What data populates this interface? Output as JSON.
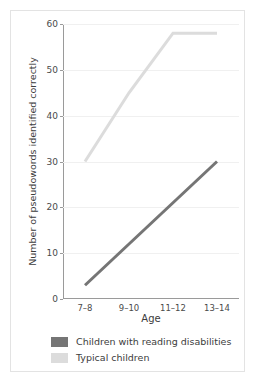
{
  "chart_data": {
    "type": "line",
    "title": "",
    "xlabel": "Age",
    "ylabel": "Number of pseudowords identified correctly",
    "categories": [
      "7–8",
      "9–10",
      "11–12",
      "13–14"
    ],
    "series": [
      {
        "name": "Children with reading disabilities",
        "values": [
          3,
          12,
          21,
          30
        ],
        "color": "#757575"
      },
      {
        "name": "Typical children",
        "values": [
          30,
          45,
          58,
          58
        ],
        "color": "#dcdcdc"
      }
    ],
    "ylim": [
      0,
      60
    ],
    "yticks": [
      0,
      10,
      20,
      30,
      40,
      50,
      60
    ],
    "ytick_labels": [
      "0",
      "10",
      "20",
      "30",
      "40",
      "50",
      "60"
    ],
    "grid": true,
    "legend_position": "bottom-left"
  },
  "colors": {
    "series_dark": "#757575",
    "series_light": "#dcdcdc",
    "axis": "#9a9a9a",
    "gridline": "#f0f0f0",
    "text": "#3c3c3c",
    "border": "#e3e3e3",
    "background": "#ffffff"
  }
}
